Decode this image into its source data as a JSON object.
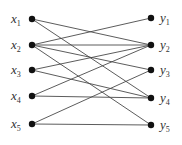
{
  "diagram": {
    "type": "bipartite-graph",
    "left_nodes": [
      {
        "id": "x1",
        "base": "x",
        "sub": "1",
        "cx": 32,
        "cy": 19
      },
      {
        "id": "x2",
        "base": "x",
        "sub": "2",
        "cx": 32,
        "cy": 45
      },
      {
        "id": "x3",
        "base": "x",
        "sub": "3",
        "cx": 32,
        "cy": 70
      },
      {
        "id": "x4",
        "base": "x",
        "sub": "4",
        "cx": 32,
        "cy": 96
      },
      {
        "id": "x5",
        "base": "x",
        "sub": "5",
        "cx": 32,
        "cy": 124
      }
    ],
    "right_nodes": [
      {
        "id": "y1",
        "base": "y",
        "sub": "1",
        "cx": 151,
        "cy": 18
      },
      {
        "id": "y2",
        "base": "y",
        "sub": "2",
        "cx": 151,
        "cy": 45
      },
      {
        "id": "y3",
        "base": "y",
        "sub": "3",
        "cx": 151,
        "cy": 70
      },
      {
        "id": "y4",
        "base": "y",
        "sub": "4",
        "cx": 151,
        "cy": 98
      },
      {
        "id": "y5",
        "base": "y",
        "sub": "5",
        "cx": 151,
        "cy": 125
      }
    ],
    "edges": [
      [
        "x1",
        "y2"
      ],
      [
        "x1",
        "y4"
      ],
      [
        "x2",
        "y1"
      ],
      [
        "x2",
        "y2"
      ],
      [
        "x2",
        "y3"
      ],
      [
        "x2",
        "y5"
      ],
      [
        "x3",
        "y2"
      ],
      [
        "x3",
        "y4"
      ],
      [
        "x4",
        "y2"
      ],
      [
        "x4",
        "y4"
      ],
      [
        "x5",
        "y3"
      ],
      [
        "x5",
        "y5"
      ]
    ],
    "colors": {
      "edge": "#4a4a4a",
      "node": "#111111",
      "label": "#333333"
    }
  }
}
